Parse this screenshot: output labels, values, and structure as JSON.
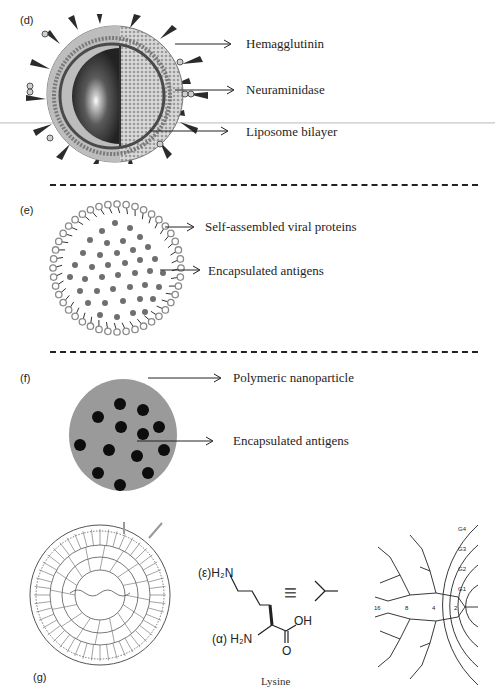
{
  "page": {
    "top_cutoff_text": "",
    "panels": {
      "d": {
        "label": "(d)",
        "title": "Influenza virus-like particle (virosome)",
        "annotations": [
          {
            "text": "Hemagglutinin"
          },
          {
            "text": "Neuraminidase"
          },
          {
            "text": "Liposome bilayer"
          }
        ]
      },
      "e": {
        "label": "(e)",
        "annotations": [
          {
            "text": "Self-assembled viral proteins"
          },
          {
            "text": "Encapsulated antigens"
          }
        ]
      },
      "f": {
        "label": "(f)",
        "annotations": [
          {
            "text": "Polymeric nanoparticle"
          },
          {
            "text": "Encapsulated antigens"
          }
        ]
      },
      "g": {
        "label": "(g)",
        "lysine": {
          "epsilon_amine": "(ε)H₂N",
          "alpha_amine": "(α) H₂N",
          "acid_oh": "OH",
          "acid_o": "O",
          "equivalence": "≡",
          "caption": "Lysine"
        },
        "dendrimer": {
          "generations": [
            "G1",
            "G2",
            "G3",
            "G4"
          ],
          "branch_counts": [
            "2",
            "4",
            "8",
            "16"
          ]
        }
      }
    },
    "colors": {
      "text": "#1e1e1e",
      "polymer_gray": "#9a9a9a",
      "antigen_black": "#0d0d0d",
      "antigen_gray": "#6f6f6f",
      "lipid_head": "#8a8a8a",
      "dash": "#222222"
    }
  }
}
